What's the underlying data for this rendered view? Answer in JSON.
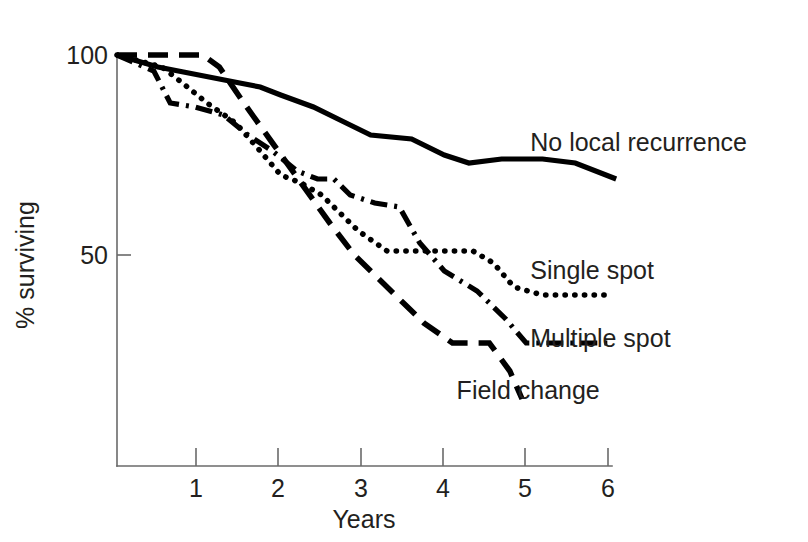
{
  "chart_data": {
    "type": "line",
    "title": "",
    "xlabel": "Years",
    "ylabel": "% surviving",
    "xlim": [
      0,
      6.3
    ],
    "ylim": [
      0,
      105
    ],
    "xticks": [
      "1",
      "2",
      "3",
      "4",
      "5",
      "6"
    ],
    "xtick_values": [
      1,
      2,
      3,
      4,
      5,
      6
    ],
    "yticks": [
      "50",
      "100"
    ],
    "ytick_values": [
      50,
      100
    ],
    "grid": false,
    "legend_position": "inline-right-of-curve-ends",
    "series": [
      {
        "name": "No local recurrence",
        "style": "solid",
        "label_x": 5.05,
        "label_y": 78,
        "x": [
          0,
          0.5,
          1.0,
          1.5,
          1.75,
          2.0,
          2.4,
          2.8,
          3.1,
          3.6,
          4.0,
          4.3,
          4.7,
          5.2,
          5.6,
          6.1
        ],
        "y": [
          100,
          97,
          95,
          93,
          92,
          90,
          87,
          83,
          80,
          79,
          75,
          73,
          74,
          74,
          73,
          69
        ]
      },
      {
        "name": "Single spot",
        "style": "dotted",
        "label_x": 5.05,
        "label_y": 46,
        "x": [
          0,
          0.55,
          0.8,
          1.1,
          1.45,
          1.75,
          2.0,
          2.25,
          2.5,
          2.7,
          2.95,
          3.3,
          3.8,
          4.35,
          4.6,
          4.85,
          5.2,
          6.0
        ],
        "y": [
          100,
          97,
          93,
          88,
          83,
          76,
          70,
          68,
          65,
          61,
          56,
          51,
          51,
          51,
          48,
          42,
          40,
          40
        ]
      },
      {
        "name": "Multiple spot",
        "style": "dash-dot",
        "label_x": 5.05,
        "label_y": 29,
        "x": [
          0,
          0.45,
          0.65,
          0.95,
          1.3,
          1.6,
          1.9,
          2.2,
          2.45,
          2.65,
          2.85,
          3.15,
          3.45,
          3.7,
          4.0,
          4.4,
          4.75,
          5.0,
          6.0
        ],
        "y": [
          100,
          96,
          88,
          87,
          85,
          80,
          76,
          71,
          69,
          69,
          65,
          63,
          62,
          53,
          46,
          41,
          34,
          28,
          28
        ]
      },
      {
        "name": "Field change",
        "style": "dashed",
        "label_x": 4.15,
        "label_y": 16,
        "x": [
          0,
          0.7,
          1.05,
          1.25,
          1.55,
          1.9,
          2.25,
          2.6,
          2.9,
          3.2,
          3.5,
          3.75,
          4.1,
          4.55,
          4.8,
          4.95
        ],
        "y": [
          100,
          100,
          100,
          97,
          88,
          78,
          68,
          58,
          50,
          44,
          38,
          33,
          28,
          28,
          21,
          14
        ]
      }
    ]
  },
  "axes": {
    "y_axis_label": "% surviving",
    "x_axis_label": "Years"
  }
}
